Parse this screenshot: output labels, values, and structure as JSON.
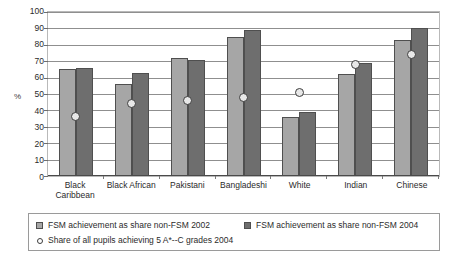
{
  "chart_data": {
    "type": "bar",
    "title": "",
    "subtitle": "",
    "xlabel": "",
    "ylabel": "%",
    "ylim": [
      0,
      100
    ],
    "ytick_step": 10,
    "yticks": [
      "100",
      "90",
      "80",
      "70",
      "60",
      "50",
      "40",
      "30",
      "20",
      "10",
      "0"
    ],
    "grid": true,
    "legend_position": "bottom",
    "categories": [
      "Black Caribbean",
      "Black African",
      "Pakistani",
      "Bangladeshi",
      "White",
      "Indian",
      "Chinese"
    ],
    "category_lines": [
      [
        "Black",
        "Caribbean"
      ],
      [
        "Black African"
      ],
      [
        "Pakistani"
      ],
      [
        "Bangladeshi"
      ],
      [
        "White"
      ],
      [
        "Indian"
      ],
      [
        "Chinese"
      ]
    ],
    "series": [
      {
        "name": "FSM achievement as share non-FSM 2002",
        "type": "bar",
        "color": "#a6a6a6",
        "values": [
          65,
          56,
          72,
          85,
          36,
          62,
          83
        ]
      },
      {
        "name": "FSM achievement as share non-FSM 2004",
        "type": "bar",
        "color": "#6e6e6e",
        "values": [
          66,
          63,
          71,
          89,
          39,
          69,
          90
        ]
      },
      {
        "name": "Share of all pupils achieving 5 A*--C grades 2004",
        "type": "scatter",
        "color": "#e8e8e8",
        "values": [
          36,
          44,
          46,
          48,
          51,
          68,
          74
        ]
      }
    ]
  },
  "legend": {
    "entries": [
      {
        "label": "FSM achievement as share non-FSM 2002",
        "marker": "square-light-gray-icon"
      },
      {
        "label": "FSM achievement as share non-FSM 2004",
        "marker": "square-dark-gray-icon"
      },
      {
        "label": "Share of all pupils achieving 5 A*--C grades 2004",
        "marker": "circle-outline-icon"
      }
    ]
  },
  "colors": {
    "series_2002": "#a6a6a6",
    "series_2004": "#6e6e6e",
    "marker_fill": "#e8e8e8",
    "gridline": "#8f8f8f",
    "plot_border": "#b9b9b9",
    "legend_border": "#9a9a9a"
  }
}
